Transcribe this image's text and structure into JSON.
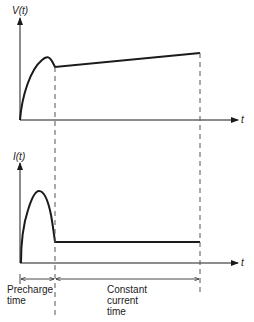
{
  "top_plot": {
    "y_label": "V(t)",
    "x_label": "t"
  },
  "bottom_plot": {
    "y_label": "I(t)",
    "x_label": "t"
  },
  "annotations": {
    "precharge_line1": "Precharge",
    "precharge_line2": "time",
    "constant_line1": "Constant",
    "constant_line2": "current",
    "constant_line3": "time"
  },
  "colors": {
    "line": "#1a1a1a",
    "dashed": "#555555",
    "background": "#ffffff"
  }
}
